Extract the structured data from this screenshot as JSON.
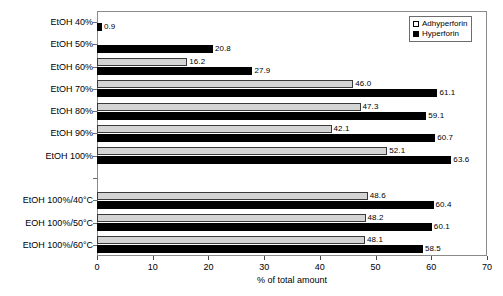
{
  "chart_data": {
    "type": "bar",
    "orientation": "horizontal",
    "title": "",
    "xlabel": "% of total amount",
    "ylabel": "",
    "xlim": [
      0,
      70
    ],
    "xticks": [
      0,
      10,
      20,
      30,
      40,
      50,
      60,
      70
    ],
    "grid": false,
    "legend_position": "top-right",
    "categories": [
      "EtOH 40%",
      "EtOH 50%",
      "EtOH 60%",
      "EtOH 70%",
      "EtOH 80%",
      "EtOH 90%",
      "EtOH 100%",
      "",
      "EtOH 100%/40°C",
      "EOH 100%/50°C",
      "EtOH 100%/60°C"
    ],
    "series": [
      {
        "name": "Adhyperforin",
        "color": "#d4d4d4",
        "values": [
          null,
          null,
          16.2,
          46.0,
          47.3,
          42.1,
          52.1,
          null,
          48.6,
          48.2,
          48.1
        ],
        "labels": [
          "",
          "",
          "16.2",
          "46.0",
          "47.3",
          "42.1",
          "52.1",
          "",
          "48.6",
          "48.2",
          "48.1"
        ]
      },
      {
        "name": "Hyperforin",
        "color": "#000000",
        "values": [
          0.9,
          20.8,
          27.9,
          61.1,
          59.1,
          60.7,
          63.6,
          null,
          60.4,
          60.1,
          58.5
        ],
        "labels": [
          "0.9",
          "20.8",
          "27.9",
          "61.1",
          "59.1",
          "60.7",
          "63.6",
          "",
          "60.4",
          "60.1",
          "58.5"
        ]
      }
    ]
  },
  "legend": {
    "items": [
      {
        "label": "Adhyperforin",
        "swatch": "open-square"
      },
      {
        "label": "Hyperforin",
        "swatch": "filled-square"
      }
    ]
  },
  "axis": {
    "x_title": "% of total amount",
    "tick_labels": [
      "0",
      "10",
      "20",
      "30",
      "40",
      "50",
      "60",
      "70"
    ]
  }
}
